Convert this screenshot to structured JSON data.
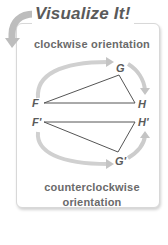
{
  "header": {
    "title": "Visualize It!"
  },
  "captions": {
    "top": "clockwise orientation",
    "bottom_line1": "counterclockwise",
    "bottom_line2": "orientation"
  },
  "triangles": {
    "upper": {
      "vertices": [
        "F",
        "G",
        "H"
      ],
      "orientation": "clockwise"
    },
    "lower": {
      "vertices": [
        "F'",
        "H'",
        "G'"
      ],
      "orientation": "counterclockwise"
    }
  },
  "labels": {
    "F": "F",
    "G": "G",
    "H": "H",
    "F_prime": "F'",
    "G_prime": "G'",
    "H_prime": "H'"
  },
  "icons": {
    "header_arrow": "curved-arrow-icon"
  },
  "colors": {
    "text": "#5a5a5a",
    "arrow": "#c8c8c8",
    "line": "#555555",
    "border": "#d8d8d8"
  }
}
